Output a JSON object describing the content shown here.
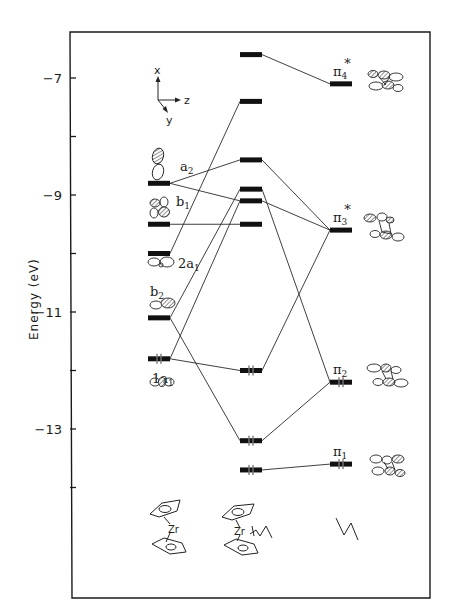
{
  "chart": {
    "ylabel": "Energy (eV)",
    "yticks": [
      {
        "value": -7,
        "label": "-7",
        "y": 78,
        "major": true
      },
      {
        "value": -8,
        "label": "",
        "y": 136,
        "major": false
      },
      {
        "value": -9,
        "label": "-9",
        "y": 195,
        "major": true
      },
      {
        "value": -10,
        "label": "",
        "y": 252,
        "major": false
      },
      {
        "value": -11,
        "label": "-11",
        "y": 310,
        "major": true
      },
      {
        "value": -12,
        "label": "",
        "y": 369,
        "major": false
      },
      {
        "value": -13,
        "label": "-13",
        "y": 427,
        "major": true
      },
      {
        "value": -14,
        "label": "",
        "y": 485,
        "major": false
      }
    ],
    "coordinate_axes": {
      "x": "x",
      "y": "y",
      "z": "z"
    }
  },
  "columns": {
    "left": {
      "name": "Cp2Zr fragment",
      "metal_label": "Zr",
      "levels": [
        {
          "id": "a2",
          "label": "a",
          "sub": "2",
          "energy": -8.8,
          "electrons": 0
        },
        {
          "id": "b1",
          "label": "b",
          "sub": "1",
          "energy": -9.5,
          "electrons": 0
        },
        {
          "id": "2a1",
          "label": "2a",
          "sub": "1",
          "energy": -10.0,
          "electrons": 0
        },
        {
          "id": "b2",
          "label": "b",
          "sub": "2",
          "energy": -11.1,
          "electrons": 0
        },
        {
          "id": "1a1",
          "label": "1a",
          "sub": "1",
          "energy": -11.8,
          "electrons": 2
        }
      ]
    },
    "middle": {
      "name": "Cp2Zr(butadiene) complex",
      "metal_label": "Zr",
      "levels": [
        {
          "id": "m1",
          "energy": -6.6,
          "electrons": 0
        },
        {
          "id": "m2",
          "energy": -7.4,
          "electrons": 0
        },
        {
          "id": "m3",
          "energy": -8.4,
          "electrons": 0
        },
        {
          "id": "m4",
          "energy": -8.9,
          "electrons": 0
        },
        {
          "id": "m5",
          "energy": -9.1,
          "electrons": 0
        },
        {
          "id": "m6",
          "energy": -9.5,
          "electrons": 0
        },
        {
          "id": "m7",
          "energy": -12.0,
          "electrons": 2
        },
        {
          "id": "m8",
          "energy": -13.2,
          "electrons": 2
        },
        {
          "id": "m9",
          "energy": -13.7,
          "electrons": 2
        }
      ]
    },
    "right": {
      "name": "butadiene",
      "levels": [
        {
          "id": "pi4",
          "label": "π",
          "sub": "4",
          "sup": "*",
          "energy": -7.1,
          "electrons": 0
        },
        {
          "id": "pi3",
          "label": "π",
          "sub": "3",
          "sup": "*",
          "energy": -9.6,
          "electrons": 0
        },
        {
          "id": "pi2",
          "label": "π",
          "sub": "2",
          "sup": "",
          "energy": -12.2,
          "electrons": 2
        },
        {
          "id": "pi1",
          "label": "π",
          "sub": "1",
          "sup": "",
          "energy": -13.6,
          "electrons": 2
        }
      ]
    }
  },
  "correlations": [
    {
      "from": "a2",
      "to": "m3"
    },
    {
      "from": "a2",
      "to": "m5"
    },
    {
      "from": "b1",
      "to": "m6"
    },
    {
      "from": "2a1",
      "to": "m2"
    },
    {
      "from": "b2",
      "to": "m4"
    },
    {
      "from": "b2",
      "to": "m8"
    },
    {
      "from": "1a1",
      "to": "m5"
    },
    {
      "from": "1a1",
      "to": "m7"
    },
    {
      "from": "m1",
      "to": "pi4"
    },
    {
      "from": "m3",
      "to": "pi3"
    },
    {
      "from": "m5",
      "to": "pi3"
    },
    {
      "from": "m4",
      "to": "pi2"
    },
    {
      "from": "m7",
      "to": "pi3"
    },
    {
      "from": "m8",
      "to": "pi2"
    },
    {
      "from": "m9",
      "to": "pi1"
    }
  ]
}
